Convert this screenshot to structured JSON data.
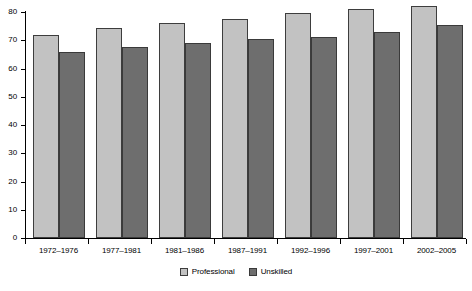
{
  "chart_data": {
    "type": "bar",
    "title": "",
    "subtitle": "",
    "xlabel": "",
    "ylabel": "",
    "ylim": [
      0,
      80
    ],
    "yticks": [
      0,
      10,
      20,
      30,
      40,
      50,
      60,
      70,
      80
    ],
    "ytick_labels": [
      "0",
      "10",
      "20",
      "30",
      "40",
      "50",
      "60",
      "70",
      "80"
    ],
    "grid": false,
    "legend_position": "bottom-center",
    "categories": [
      "1972–1976",
      "1977–1981",
      "1981–1986",
      "1987–1991",
      "1992–1996",
      "1997–2001",
      "2002–2005"
    ],
    "series": [
      {
        "name": "Professional",
        "color": "#c2c2c2",
        "values": [
          72,
          74.5,
          76,
          77.5,
          79.5,
          81,
          82
        ]
      },
      {
        "name": "Unskilled",
        "color": "#6e6e6e",
        "values": [
          66,
          67.5,
          69,
          70.5,
          71,
          73,
          75.5
        ]
      }
    ]
  },
  "legend": {
    "items": [
      {
        "label": "Professional",
        "color": "#c2c2c2"
      },
      {
        "label": "Unskilled",
        "color": "#6e6e6e"
      }
    ]
  },
  "colors": {
    "professional": "#c2c2c2",
    "unskilled": "#6e6e6e",
    "axis": "#000000",
    "background": "#ffffff"
  }
}
